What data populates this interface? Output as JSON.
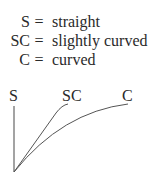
{
  "legend": [
    {
      "abbr": "S",
      "eq": "=",
      "desc": "straight"
    },
    {
      "abbr": "SC",
      "eq": "=",
      "desc": "slightly curved"
    },
    {
      "abbr": "C",
      "eq": "=",
      "desc": "curved"
    }
  ],
  "diagram": {
    "labels": {
      "s": "S",
      "sc": "SC",
      "c": "C"
    },
    "line_color": "#555555"
  }
}
